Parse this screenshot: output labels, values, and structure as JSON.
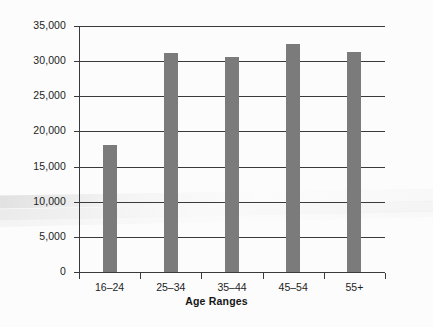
{
  "chart_data": {
    "type": "bar",
    "title": "",
    "xlabel": "Age Ranges",
    "ylabel": "",
    "categories": [
      "16–24",
      "25–34",
      "35–44",
      "45–54",
      "55+"
    ],
    "values": [
      18000,
      31100,
      30600,
      32400,
      31300
    ],
    "ylim": [
      0,
      35000
    ],
    "ytick_values": [
      0,
      5000,
      10000,
      15000,
      20000,
      25000,
      30000,
      35000
    ],
    "ytick_labels": [
      "0",
      "5,000",
      "10,000",
      "15,000",
      "20,000",
      "25,000",
      "30,000",
      "35,000"
    ],
    "grid": true,
    "legend": false,
    "series": [
      {
        "name": "",
        "values": [
          18000,
          31100,
          30600,
          32400,
          31300
        ]
      }
    ],
    "colors": {
      "bar": "#7b7b7b",
      "axis": "#3a3a3a",
      "grid": "#3a3a3a",
      "text": "#1c1c1c",
      "background": "#fcfcfc"
    }
  }
}
